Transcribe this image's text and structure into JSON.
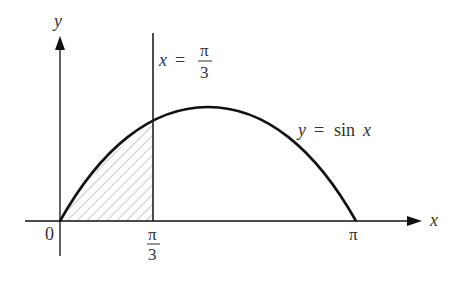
{
  "diagram": {
    "axes": {
      "x_label": "x",
      "y_label": "y",
      "origin_label": "0",
      "x_ticks": [
        {
          "label_num": "π",
          "label_den": "3",
          "value": "π/3"
        },
        {
          "label": "π",
          "value": "π"
        }
      ]
    },
    "curve": {
      "label": "y = sin x",
      "label_lhs": "y",
      "label_eq": "=",
      "label_fn": "sin",
      "label_var": "x"
    },
    "vertical_line": {
      "label_lhs": "x",
      "label_eq": "=",
      "label_num": "π",
      "label_den": "3"
    },
    "shaded_region": "area between y = sin x and x-axis for 0 ≤ x ≤ π/3 (hatched)",
    "colors": {
      "stroke": "#111111",
      "hatch": "#777777",
      "text": "#333333",
      "background": "#ffffff"
    }
  }
}
